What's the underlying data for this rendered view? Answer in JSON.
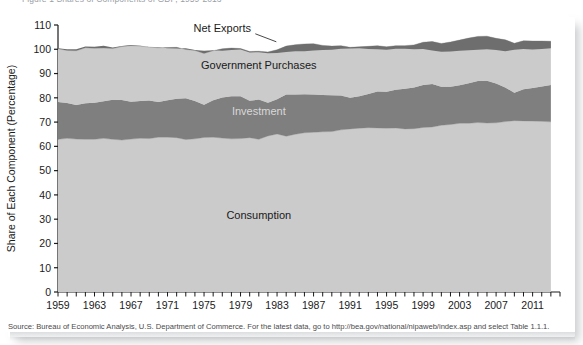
{
  "caption": {
    "cutoff_text": "Figure 1  Shares of Components of GDP, 1959-2013"
  },
  "source": {
    "text": "Source: Bureau of Economic Analysis, U.S. Department of Commerce. For the latest data, go to http://bea.gov/national/nipaweb/index.asp and select Table 1.1.1."
  },
  "chart_data": {
    "type": "area",
    "title": "",
    "xlabel": "",
    "ylabel": "Share of Each Component (Percentage)",
    "ylim": [
      0,
      110
    ],
    "yticks": [
      0,
      10,
      20,
      30,
      40,
      50,
      60,
      70,
      80,
      90,
      100,
      110
    ],
    "xlim": [
      1959,
      2014
    ],
    "xticks": [
      1959,
      1963,
      1967,
      1971,
      1975,
      1979,
      1983,
      1987,
      1991,
      1995,
      1999,
      2003,
      2007,
      2011
    ],
    "xtick_step_minor": 1,
    "grid": false,
    "legend_position": "inline-annotations",
    "stacked": true,
    "annotations": [
      {
        "name": "net-exports-label",
        "text": "Net Exports",
        "x": 1977,
        "y": 107,
        "leader": true
      },
      {
        "name": "government-purchases-label",
        "text": "Government Purchases",
        "x": 1981,
        "y": 92,
        "leader": false
      },
      {
        "name": "investment-label",
        "text": "Investment",
        "x": 1981,
        "y": 73,
        "leader": false
      },
      {
        "name": "consumption-label",
        "text": "Consumption",
        "x": 1981,
        "y": 30,
        "leader": false
      }
    ],
    "colors": {
      "consumption": "#cbcbcb",
      "investment": "#7f7f7f",
      "government": "#cbcbcb",
      "net_exports": "#6e6e6e",
      "separator": "#8a8a8a"
    },
    "x": [
      1959,
      1960,
      1961,
      1962,
      1963,
      1964,
      1965,
      1966,
      1967,
      1968,
      1969,
      1970,
      1971,
      1972,
      1973,
      1974,
      1975,
      1976,
      1977,
      1978,
      1979,
      1980,
      1981,
      1982,
      1983,
      1984,
      1985,
      1986,
      1987,
      1988,
      1989,
      1990,
      1991,
      1992,
      1993,
      1994,
      1995,
      1996,
      1997,
      1998,
      1999,
      2000,
      2001,
      2002,
      2003,
      2004,
      2005,
      2006,
      2007,
      2008,
      2009,
      2010,
      2011,
      2012,
      2013
    ],
    "series": [
      {
        "name": "Consumption",
        "values": [
          62.9,
          63.3,
          63.0,
          62.9,
          62.9,
          63.3,
          62.9,
          62.6,
          63.0,
          63.3,
          63.2,
          63.8,
          63.8,
          63.6,
          62.8,
          63.1,
          63.7,
          63.8,
          63.4,
          63.1,
          63.2,
          63.6,
          62.9,
          64.3,
          65.1,
          64.2,
          65.0,
          65.6,
          65.8,
          66.0,
          66.1,
          66.8,
          67.2,
          67.5,
          67.7,
          67.6,
          67.5,
          67.6,
          67.2,
          67.3,
          67.8,
          68.0,
          68.7,
          69.0,
          69.5,
          69.5,
          69.8,
          69.6,
          69.7,
          70.2,
          70.6,
          70.5,
          70.4,
          70.3,
          70.1
        ]
      },
      {
        "name": "Investment",
        "values": [
          15.4,
          14.6,
          14.0,
          14.9,
          15.1,
          15.3,
          16.3,
          16.5,
          15.4,
          15.4,
          15.7,
          14.5,
          15.2,
          16.0,
          17.0,
          15.6,
          13.4,
          15.2,
          16.7,
          17.5,
          17.4,
          15.2,
          16.4,
          13.7,
          14.3,
          17.2,
          16.4,
          15.9,
          15.6,
          15.2,
          15.0,
          14.2,
          12.8,
          13.1,
          13.9,
          15.0,
          15.0,
          15.7,
          16.5,
          17.0,
          17.5,
          17.7,
          15.9,
          15.6,
          15.7,
          16.5,
          17.1,
          17.4,
          16.2,
          14.1,
          11.5,
          13.0,
          13.6,
          14.4,
          15.2
        ]
      },
      {
        "name": "Government Purchases",
        "values": [
          21.9,
          21.6,
          22.4,
          22.8,
          22.4,
          21.9,
          21.1,
          22.0,
          23.1,
          22.6,
          22.0,
          22.3,
          21.7,
          21.2,
          20.1,
          20.8,
          21.2,
          20.4,
          20.1,
          19.9,
          19.7,
          20.3,
          19.9,
          20.9,
          20.4,
          19.9,
          20.5,
          20.7,
          20.9,
          20.4,
          20.2,
          20.5,
          20.8,
          20.4,
          19.6,
          18.9,
          18.5,
          18.2,
          17.8,
          17.5,
          17.6,
          17.5,
          17.8,
          18.4,
          18.6,
          18.6,
          18.4,
          18.4,
          18.6,
          19.6,
          20.4,
          20.0,
          19.4,
          18.7,
          18.0
        ]
      },
      {
        "name": "Net Exports",
        "values": [
          0.2,
          0.5,
          0.6,
          0.5,
          0.6,
          0.9,
          0.4,
          0.2,
          0.3,
          0.1,
          0.0,
          0.2,
          -0.3,
          -0.5,
          0.5,
          0.2,
          1.1,
          0.2,
          -0.8,
          -0.8,
          -0.4,
          -0.4,
          -0.4,
          -0.5,
          -1.3,
          -2.4,
          -2.7,
          -3.0,
          -2.8,
          -1.9,
          -1.5,
          -1.3,
          -0.5,
          -0.6,
          -1.1,
          -1.5,
          -1.2,
          -1.3,
          -1.3,
          -1.8,
          -2.8,
          -3.7,
          -3.4,
          -3.9,
          -4.4,
          -5.0,
          -5.5,
          -5.4,
          -4.8,
          -4.7,
          -2.7,
          -3.4,
          -3.5,
          -3.3,
          -2.9
        ]
      }
    ]
  }
}
